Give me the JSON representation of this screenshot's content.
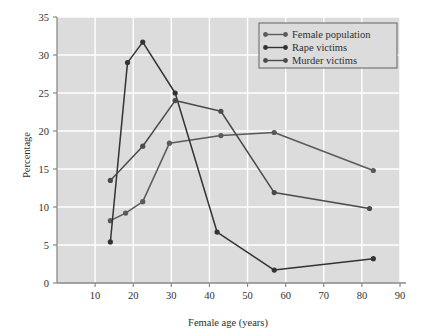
{
  "chart_data": {
    "type": "line",
    "title": "",
    "xlabel": "Female age (years)",
    "ylabel": "Percentage",
    "xlim": [
      0,
      90
    ],
    "ylim": [
      0,
      35
    ],
    "xticks": [
      10,
      20,
      30,
      40,
      50,
      60,
      70,
      80,
      90
    ],
    "xtick_labels": [
      "10",
      "20",
      "30",
      "40",
      "50",
      "60",
      "70",
      "80",
      "90"
    ],
    "yticks": [
      0,
      5,
      10,
      15,
      20,
      25,
      30,
      35
    ],
    "ytick_labels": [
      "0",
      "5",
      "10",
      "15",
      "20",
      "25",
      "30",
      "35"
    ],
    "grid": true,
    "grid_color": "#ffffff",
    "plot_background": "#dcdcdc",
    "legend_position": "top-right",
    "series": [
      {
        "name": "Female population",
        "color": "#5a5a5a",
        "marker": "circle",
        "points": [
          {
            "x": 14.0,
            "y": 8.2
          },
          {
            "x": 18.0,
            "y": 9.2
          },
          {
            "x": 22.5,
            "y": 10.7
          },
          {
            "x": 29.5,
            "y": 18.4
          },
          {
            "x": 43.0,
            "y": 19.4
          },
          {
            "x": 57.0,
            "y": 19.8
          },
          {
            "x": 83.0,
            "y": 14.8
          }
        ]
      },
      {
        "name": "Rape victims",
        "color": "#333333",
        "marker": "circle",
        "points": [
          {
            "x": 14.0,
            "y": 5.4
          },
          {
            "x": 18.5,
            "y": 29.0
          },
          {
            "x": 22.5,
            "y": 31.7
          },
          {
            "x": 31.0,
            "y": 25.0
          },
          {
            "x": 42.0,
            "y": 6.7
          },
          {
            "x": 57.0,
            "y": 1.7
          },
          {
            "x": 83.0,
            "y": 3.2
          }
        ]
      },
      {
        "name": "Murder victims",
        "color": "#4a4a4a",
        "marker": "circle",
        "points": [
          {
            "x": 14.0,
            "y": 13.5
          },
          {
            "x": 22.5,
            "y": 18.0
          },
          {
            "x": 31.0,
            "y": 24.0
          },
          {
            "x": 43.0,
            "y": 22.6
          },
          {
            "x": 57.0,
            "y": 11.9
          },
          {
            "x": 82.0,
            "y": 9.8
          }
        ]
      }
    ]
  }
}
